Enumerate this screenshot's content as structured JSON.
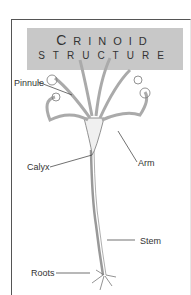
{
  "title": {
    "line1_first": "C",
    "line1_rest": "RINOID",
    "line2": "STRUCTURE"
  },
  "labels": {
    "pinnule": "Pinnule",
    "calyx": "Calyx",
    "arm": "Arm",
    "stem": "Stem",
    "roots": "Roots"
  }
}
